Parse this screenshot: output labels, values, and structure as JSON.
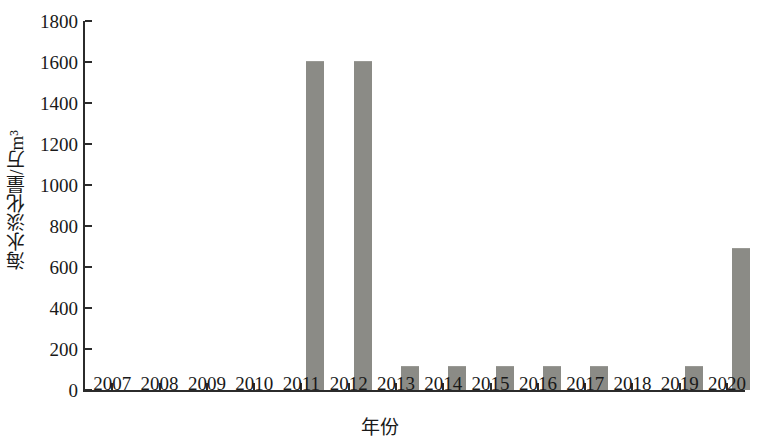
{
  "chart_data": {
    "type": "bar",
    "title": "",
    "xlabel": "年份",
    "ylabel": "海水淡化量/万m³",
    "categories": [
      "2007",
      "2008",
      "2009",
      "2010",
      "2011",
      "2012",
      "2013",
      "2014",
      "2015",
      "2016",
      "2017",
      "2018",
      "2019",
      "2020"
    ],
    "values": [
      0,
      0,
      0,
      0,
      1600,
      1600,
      110,
      110,
      110,
      110,
      110,
      0,
      110,
      690
    ],
    "ylim": [
      0,
      1800
    ],
    "ytick_values": [
      0,
      200,
      400,
      600,
      800,
      1000,
      1200,
      1400,
      1600,
      1800
    ],
    "ytick_labels": [
      "0",
      "200",
      "400",
      "600",
      "800",
      "1000",
      "1200",
      "1400",
      "1600",
      "1800"
    ],
    "grid": false,
    "legend": "none",
    "series": [
      {
        "name": "海水淡化量",
        "values": [
          0,
          0,
          0,
          0,
          1600,
          1600,
          110,
          110,
          110,
          110,
          110,
          0,
          110,
          690
        ]
      }
    ],
    "colors": {
      "bar": "#8b8b86",
      "axis": "#2b2b2b",
      "text": "#191919",
      "background": "#ffffff"
    }
  }
}
